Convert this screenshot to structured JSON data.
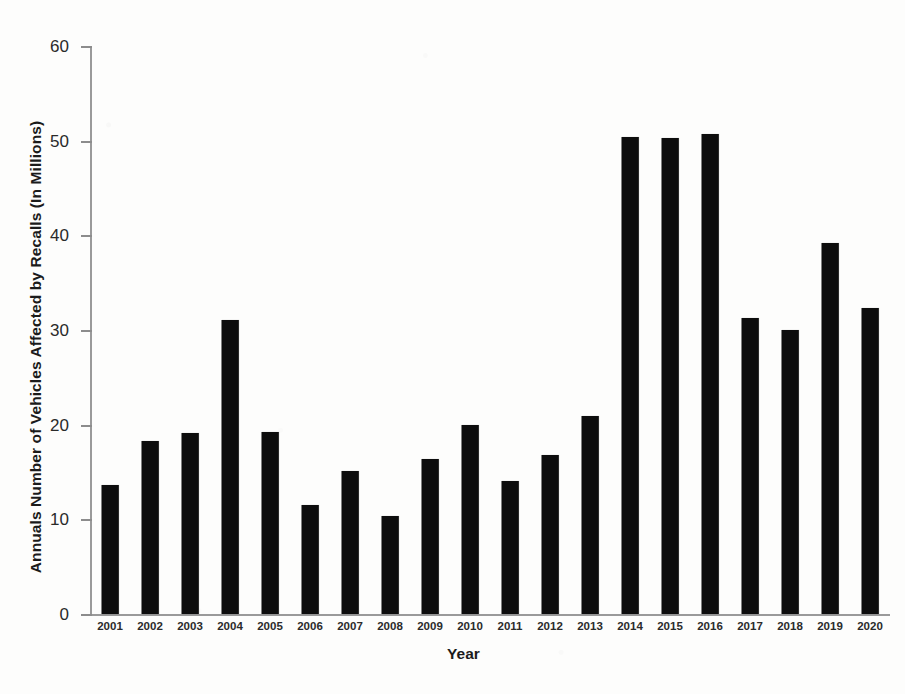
{
  "chart_data": {
    "type": "bar",
    "title": "",
    "xlabel": "Year",
    "ylabel": "Annuals Number of Vehicles Affected by Recalls (In Millions)",
    "categories": [
      "2001",
      "2002",
      "2003",
      "2004",
      "2005",
      "2006",
      "2007",
      "2008",
      "2009",
      "2010",
      "2011",
      "2012",
      "2013",
      "2014",
      "2015",
      "2016",
      "2017",
      "2018",
      "2019",
      "2020"
    ],
    "values": [
      13.6,
      18.3,
      19.1,
      31.1,
      19.2,
      11.5,
      15.1,
      10.4,
      16.4,
      20.0,
      14.0,
      16.8,
      20.9,
      50.4,
      50.3,
      50.7,
      31.3,
      30.0,
      39.2,
      32.3
    ],
    "ylim": [
      0,
      60
    ],
    "ytick_values": [
      0,
      10,
      20,
      30,
      40,
      50,
      60
    ],
    "ytick_labels": [
      "0",
      "10",
      "20",
      "30",
      "40",
      "50",
      "60"
    ],
    "grid": false,
    "legend": null,
    "legend_position": "none",
    "bar_color": "#0d0d0d",
    "axis_color": "#9a9a9a",
    "background_color": "#fdfdfc"
  }
}
